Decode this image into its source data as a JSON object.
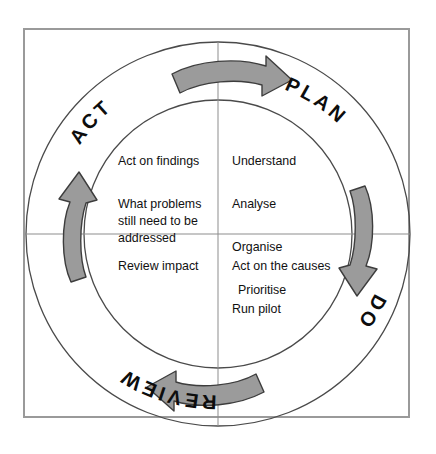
{
  "diagram": {
    "type": "cycle-diagram",
    "direction": "clockwise",
    "colors": {
      "arrow_fill": "#9b9b9b",
      "arrow_stroke": "#3d3d3d",
      "circle_stroke": "#4a4a4a",
      "frame_stroke": "#9a9a9a",
      "text": "#111111",
      "background": "#ffffff"
    },
    "frame": {
      "label": "diagram-frame"
    },
    "ring_labels": {
      "plan": "PLAN",
      "do": "DO",
      "review": "REVIEW",
      "act": "ACT"
    },
    "quadrants": {
      "plan": {
        "heading": "PLAN",
        "items": [
          "Understand",
          "Analyse",
          "Organise",
          "Prioritise"
        ]
      },
      "do": {
        "heading": "DO",
        "items": [
          "Act on the causes",
          "Run pilot"
        ]
      },
      "review": {
        "heading": "REVIEW",
        "items": [
          "Review impact"
        ]
      },
      "act": {
        "heading": "ACT",
        "items": [
          "Act on findings",
          "What problems still need to be addressed"
        ],
        "line1": "Act on findings",
        "line2": "What problems\nstill need to be\naddressed"
      }
    },
    "arrows": {
      "top": "arrow-clockwise-top",
      "right": "arrow-clockwise-right",
      "bottom": "arrow-clockwise-bottom",
      "left": "arrow-clockwise-left"
    }
  }
}
